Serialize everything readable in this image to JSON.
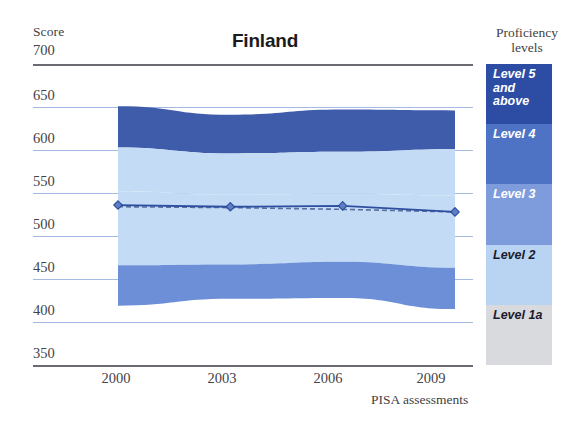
{
  "chart_data": {
    "type": "area",
    "title": "Finland",
    "xlabel": "PISA assessments",
    "ylabel": "Score",
    "ylim": [
      350,
      700
    ],
    "ytick_labels": [
      "700",
      "650",
      "600",
      "550",
      "500",
      "450",
      "400",
      "350"
    ],
    "ytick_values": [
      700,
      650,
      600,
      550,
      500,
      450,
      400,
      350
    ],
    "categories": [
      "2000",
      "2003",
      "2006",
      "2009"
    ],
    "x": [
      2000,
      2003,
      2006,
      2009
    ],
    "grid": true,
    "legend_position": "right",
    "series": [
      {
        "name": "Mean score",
        "style": "solid-line-with-diamond-markers",
        "color": "#2e4fa0",
        "values": [
          536,
          534,
          535,
          528
        ]
      },
      {
        "name": "Trend line",
        "style": "dashed",
        "color": "#5a6f9e",
        "values": [
          534,
          533,
          531,
          528
        ]
      }
    ],
    "bands": [
      {
        "name": "Level 5 and above",
        "color": "#3f5cab",
        "upper": [
          651,
          641,
          647,
          646
        ],
        "lower": [
          603,
          596,
          598,
          601
        ]
      },
      {
        "name": "Level 4",
        "color": "#c3dbf4",
        "upper": [
          603,
          596,
          598,
          601
        ],
        "lower": [
          552,
          548,
          549,
          547
        ]
      },
      {
        "name": "Level 3",
        "color": "#c3dbf4",
        "upper": [
          552,
          548,
          549,
          547
        ],
        "lower": [
          466,
          467,
          470,
          463
        ]
      },
      {
        "name": "Level 2",
        "color": "#6d8fd8",
        "upper": [
          466,
          467,
          470,
          463
        ],
        "lower": [
          419,
          427,
          428,
          415
        ]
      }
    ]
  },
  "axes": {
    "score_label": "Score",
    "x_axis_title": "PISA assessments"
  },
  "legend": {
    "title_line1": "Proficiency",
    "title_line2": "levels",
    "items": [
      {
        "label": "Level 5\nand\nabove",
        "color": "#2d4da4",
        "text_color": "#ffffff"
      },
      {
        "label": "Level 4",
        "color": "#4f73c4",
        "text_color": "#ffffff"
      },
      {
        "label": "Level 3",
        "color": "#7e9cdc",
        "text_color": "#ffffff"
      },
      {
        "label": "Level 2",
        "color": "#b9d4f2",
        "text_color": "#1b1b2e"
      },
      {
        "label": "Level 1a",
        "color": "#d9dadd",
        "text_color": "#1b1b2e"
      }
    ]
  },
  "colors": {
    "grid": "#9fb6e2",
    "axis": "#6a6a72",
    "line": "#2e4fa0",
    "dash": "#5a6f9e"
  }
}
